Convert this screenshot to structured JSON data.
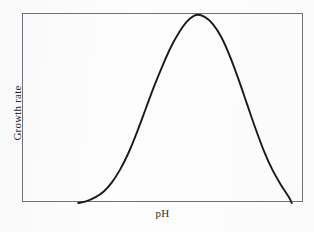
{
  "figure": {
    "name": "growth-rate-vs-ph-curve",
    "background_color": "#fdfdfd",
    "frame_color": "#6f7177",
    "curve_color": "#1a1a1a",
    "label_color": "#2b2b2b"
  },
  "chart_data": {
    "type": "line",
    "title": "",
    "subtitle": "",
    "xlabel": "pH",
    "ylabel": "Growth rate",
    "grid": false,
    "legend": null,
    "axis_ticks": {
      "x": [],
      "y": []
    },
    "xlim": [
      0,
      100
    ],
    "ylim": [
      0,
      100
    ],
    "annotations": [],
    "series": [
      {
        "name": "Growth rate",
        "description": "Bell-shaped optimum curve: growth rate is near zero at low pH, rises to a single maximum at intermediate pH, then falls back to near zero at high pH.",
        "x": [
          20,
          23,
          26,
          29,
          32,
          35,
          38,
          41,
          44,
          47,
          50,
          53,
          56,
          59,
          62,
          65,
          68,
          71,
          74,
          77,
          80,
          83,
          86,
          89,
          92,
          95,
          96
        ],
        "y": [
          0,
          1,
          3,
          6,
          11,
          18,
          27,
          38,
          50,
          62,
          73,
          83,
          91,
          97,
          100,
          99,
          95,
          88,
          78,
          66,
          53,
          40,
          28,
          18,
          10,
          3,
          0
        ]
      }
    ]
  },
  "labels": {
    "x_axis": "pH",
    "y_axis": "Growth rate"
  }
}
